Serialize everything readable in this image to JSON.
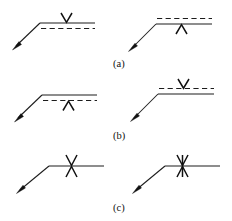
{
  "figure": {
    "background_color": "#ffffff",
    "line_color": "#1c1c1c",
    "symbol_color": "#111111",
    "rows": [
      {
        "id": "row-a",
        "caption": "(a)",
        "left": {
          "id": "a-left",
          "symbol_glyph": "V",
          "symbol_position": "above-reference-line",
          "dashed_line_position": "below-reference-line",
          "arrow_direction": "down-left"
        },
        "right": {
          "id": "a-right",
          "symbol_glyph": "Λ",
          "symbol_position": "below-reference-line",
          "dashed_line_position": "above-reference-line",
          "arrow_direction": "down-left"
        }
      },
      {
        "id": "row-b",
        "caption": "(b)",
        "left": {
          "id": "b-left",
          "symbol_glyph": "Λ",
          "symbol_position": "below-reference-line",
          "dashed_line_position": "below-reference-line",
          "arrow_direction": "down-left"
        },
        "right": {
          "id": "b-right",
          "symbol_glyph": "V",
          "symbol_position": "above-reference-line",
          "dashed_line_position": "above-reference-line",
          "arrow_direction": "down-left"
        }
      },
      {
        "id": "row-c",
        "caption": "(c)",
        "left": {
          "id": "c-left",
          "symbol_glyph": "X",
          "symbol_position": "straddling-reference-line",
          "dashed_line_position": "none",
          "arrow_direction": "down-left"
        },
        "right": {
          "id": "c-right",
          "symbol_glyph": "X",
          "symbol_position": "straddling-reference-line",
          "dashed_line_position": "none",
          "arrow_direction": "down-left"
        }
      }
    ],
    "captions": {
      "a": "(a)",
      "b": "(b)",
      "c": "(c)"
    }
  }
}
